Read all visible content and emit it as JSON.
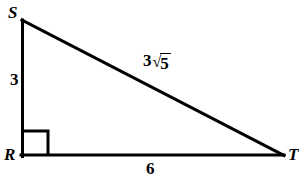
{
  "figure": {
    "kind": "right-triangle-diagram",
    "background_color": "#ffffff",
    "stroke_color": "#000000",
    "stroke_width": 3,
    "vertices": {
      "S": {
        "label": "S",
        "x": 21,
        "y": 20
      },
      "R": {
        "label": "R",
        "x": 21,
        "y": 155
      },
      "T": {
        "label": "T",
        "x": 283,
        "y": 155
      }
    },
    "sides": {
      "SR": {
        "measure": "3"
      },
      "RT": {
        "measure": "6"
      },
      "ST": {
        "coefficient": "3",
        "radical_sign": "√",
        "radicand": "5",
        "measure": "3√5"
      }
    },
    "right_angle": {
      "at_vertex": "R",
      "marker": "square",
      "size": 25
    }
  }
}
